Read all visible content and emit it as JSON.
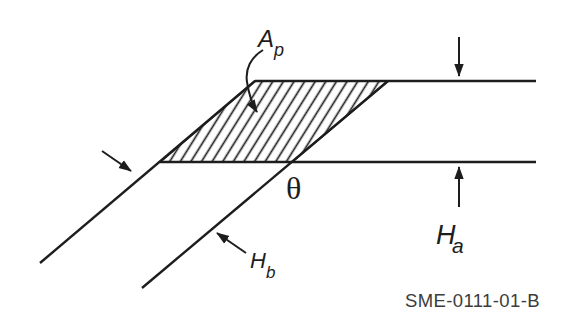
{
  "figure": {
    "id_label": "SME-0111-01-B",
    "labels": {
      "area": {
        "main": "A",
        "sub": "p"
      },
      "angle": "θ",
      "height_a": {
        "main": "H",
        "sub": "a"
      },
      "height_b": {
        "main": "H",
        "sub": "b"
      }
    },
    "colors": {
      "line": "#1d1d1d",
      "background": "#ffffff",
      "figure_id_text": "#3c3c3c"
    }
  }
}
